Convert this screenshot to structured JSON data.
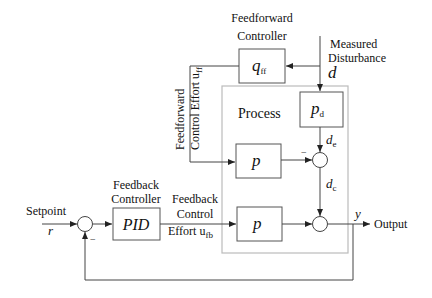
{
  "diagram": {
    "blocks": {
      "feedforward_controller": {
        "label_line1": "Feedforward",
        "label_line2": "Controller",
        "symbol": "q",
        "subscript": "ff"
      },
      "disturbance_model": {
        "symbol": "p",
        "subscript": "d"
      },
      "process_upper": {
        "symbol": "p"
      },
      "process_lower": {
        "symbol": "p"
      },
      "feedback_controller": {
        "label_line1": "Feedback",
        "label_line2": "Controller",
        "symbol": "PID"
      },
      "process_group": {
        "label": "Process"
      }
    },
    "signals": {
      "measured_disturbance": {
        "label_line1": "Measured",
        "label_line2": "Disturbance",
        "symbol": "d"
      },
      "feedforward_effort": {
        "label_line1": "Feedforward",
        "label_line2": "Control Effort u",
        "subscript": "ff"
      },
      "feedback_effort": {
        "label_line1": "Feedback",
        "label_line2": "Control",
        "label_line3": "Effort u",
        "subscript": "fb"
      },
      "setpoint": {
        "label": "Setpoint",
        "symbol": "r"
      },
      "output": {
        "label": "Output",
        "symbol": "y"
      },
      "de": {
        "symbol": "d",
        "subscript": "e"
      },
      "dc": {
        "symbol": "d",
        "subscript": "c"
      }
    },
    "summing_signs": {
      "upper_sum_minus": "−",
      "setpoint_sum_minus": "−"
    }
  }
}
